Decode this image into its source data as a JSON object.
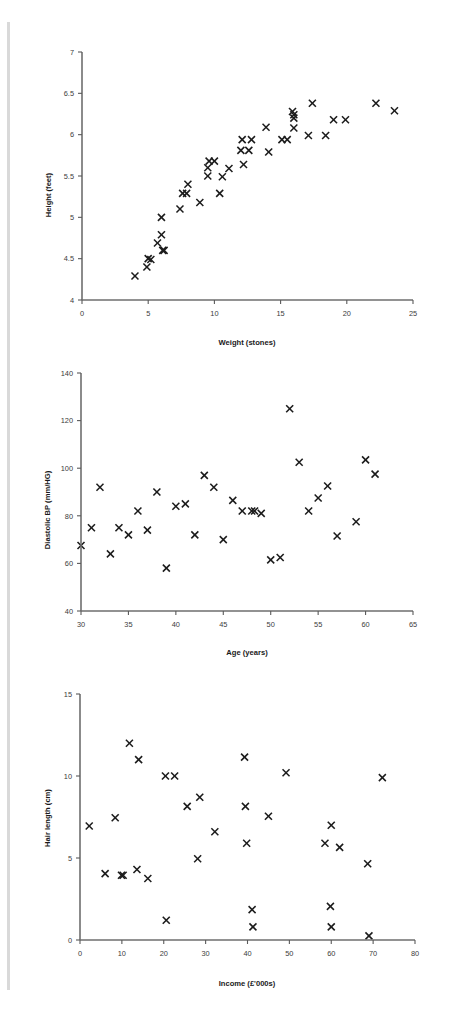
{
  "page": {
    "background_color": "#ffffff",
    "edge_bar_color": "#d9d9d9",
    "marker_color": "#1c1c1c",
    "axis_color": "#5a5a5a"
  },
  "charts": [
    {
      "id": "height-weight-scatter",
      "title": "",
      "xlabel": "Weight (stones)",
      "ylabel": "Height (feet)",
      "xticks": [
        "0",
        "5",
        "10",
        "15",
        "20",
        "25"
      ],
      "yticks": [
        "4",
        "4.5",
        "5",
        "5.5",
        "6",
        "6.5",
        "7"
      ]
    },
    {
      "id": "bp-age-scatter",
      "title": "",
      "xlabel": "Age (years)",
      "ylabel": "Diastolic BP (mm/HG)",
      "xticks": [
        "30",
        "35",
        "40",
        "45",
        "50",
        "55",
        "60",
        "65"
      ],
      "yticks": [
        "40",
        "60",
        "80",
        "100",
        "120",
        "140"
      ]
    },
    {
      "id": "hair-income-scatter",
      "title": "",
      "xlabel": "Income (£'000s)",
      "ylabel": "Hair length (cm)",
      "xticks": [
        "0",
        "10",
        "20",
        "30",
        "40",
        "50",
        "60",
        "70",
        "80"
      ],
      "yticks": [
        "0",
        "5",
        "10",
        "15"
      ]
    }
  ],
  "chart_data": [
    {
      "type": "scatter",
      "title": "",
      "xlabel": "Weight (stones)",
      "ylabel": "Height (feet)",
      "xlim": [
        0,
        25
      ],
      "ylim": [
        4,
        7
      ],
      "xticks": [
        0,
        5,
        10,
        15,
        20,
        25
      ],
      "yticks": [
        4,
        4.5,
        5,
        5.5,
        6,
        6.5,
        7
      ],
      "grid": false,
      "legend": "none",
      "marker": "x",
      "points": [
        [
          4.0,
          4.29
        ],
        [
          4.9,
          4.4
        ],
        [
          5.0,
          4.5
        ],
        [
          5.2,
          4.49
        ],
        [
          5.7,
          4.69
        ],
        [
          6.0,
          5.0
        ],
        [
          6.0,
          4.79
        ],
        [
          6.1,
          4.6
        ],
        [
          6.2,
          4.6
        ],
        [
          7.4,
          5.1
        ],
        [
          7.6,
          5.29
        ],
        [
          7.9,
          5.29
        ],
        [
          8.0,
          5.4
        ],
        [
          8.9,
          5.18
        ],
        [
          9.5,
          5.5
        ],
        [
          9.5,
          5.6
        ],
        [
          9.6,
          5.68
        ],
        [
          10.0,
          5.68
        ],
        [
          10.4,
          5.29
        ],
        [
          10.6,
          5.49
        ],
        [
          11.1,
          5.59
        ],
        [
          12.0,
          5.81
        ],
        [
          12.1,
          5.94
        ],
        [
          12.2,
          5.64
        ],
        [
          12.6,
          5.81
        ],
        [
          12.8,
          5.94
        ],
        [
          13.9,
          6.09
        ],
        [
          14.1,
          5.79
        ],
        [
          15.1,
          5.94
        ],
        [
          15.5,
          5.94
        ],
        [
          15.9,
          6.28
        ],
        [
          16.0,
          6.24
        ],
        [
          16.0,
          6.2
        ],
        [
          16.0,
          6.08
        ],
        [
          17.1,
          5.99
        ],
        [
          17.4,
          6.38
        ],
        [
          18.4,
          5.99
        ],
        [
          19.0,
          6.18
        ],
        [
          19.9,
          6.18
        ],
        [
          22.2,
          6.38
        ],
        [
          23.6,
          6.29
        ]
      ]
    },
    {
      "type": "scatter",
      "title": "",
      "xlabel": "Age (years)",
      "ylabel": "Diastolic BP (mm/HG)",
      "xlim": [
        30,
        65
      ],
      "ylim": [
        40,
        140
      ],
      "xticks": [
        30,
        35,
        40,
        45,
        50,
        55,
        60,
        65
      ],
      "yticks": [
        40,
        60,
        80,
        100,
        120,
        140
      ],
      "grid": false,
      "legend": "none",
      "marker": "x",
      "points": [
        [
          30.0,
          67.5
        ],
        [
          31.1,
          75.0
        ],
        [
          32.0,
          92.0
        ],
        [
          33.1,
          64.0
        ],
        [
          34.0,
          75.0
        ],
        [
          35.0,
          72.0
        ],
        [
          36.0,
          82.0
        ],
        [
          37.0,
          74.0
        ],
        [
          38.0,
          90.0
        ],
        [
          39.0,
          58.0
        ],
        [
          40.0,
          84.0
        ],
        [
          41.0,
          85.0
        ],
        [
          42.0,
          72.0
        ],
        [
          43.0,
          97.0
        ],
        [
          44.0,
          92.0
        ],
        [
          45.0,
          70.0
        ],
        [
          46.0,
          86.5
        ],
        [
          47.0,
          82.0
        ],
        [
          48.0,
          82.0
        ],
        [
          48.3,
          82.0
        ],
        [
          49.0,
          81.0
        ],
        [
          50.0,
          61.5
        ],
        [
          51.0,
          62.5
        ],
        [
          52.0,
          125.0
        ],
        [
          53.0,
          102.5
        ],
        [
          54.0,
          82.0
        ],
        [
          55.0,
          87.5
        ],
        [
          56.0,
          92.5
        ],
        [
          57.0,
          71.5
        ],
        [
          59.0,
          77.5
        ],
        [
          60.0,
          103.5
        ],
        [
          61.0,
          97.5
        ]
      ]
    },
    {
      "type": "scatter",
      "title": "",
      "xlabel": "Income (£'000s)",
      "ylabel": "Hair length (cm)",
      "xlim": [
        0,
        80
      ],
      "ylim": [
        0,
        15
      ],
      "xticks": [
        0,
        10,
        20,
        30,
        40,
        50,
        60,
        70,
        80
      ],
      "yticks": [
        0,
        5,
        10,
        15
      ],
      "grid": false,
      "legend": "none",
      "marker": "x",
      "points": [
        [
          2.2,
          6.95
        ],
        [
          6.0,
          4.05
        ],
        [
          8.4,
          7.45
        ],
        [
          9.9,
          3.95
        ],
        [
          10.3,
          3.95
        ],
        [
          11.8,
          12.0
        ],
        [
          13.6,
          4.3
        ],
        [
          14.0,
          11.0
        ],
        [
          16.2,
          3.75
        ],
        [
          20.4,
          10.0
        ],
        [
          20.6,
          1.2
        ],
        [
          22.6,
          10.0
        ],
        [
          25.6,
          8.15
        ],
        [
          28.1,
          4.95
        ],
        [
          28.6,
          8.7
        ],
        [
          32.2,
          6.6
        ],
        [
          39.3,
          11.15
        ],
        [
          39.5,
          8.15
        ],
        [
          39.8,
          5.9
        ],
        [
          41.1,
          1.85
        ],
        [
          41.3,
          0.8
        ],
        [
          45.0,
          7.55
        ],
        [
          49.2,
          10.2
        ],
        [
          58.5,
          5.9
        ],
        [
          59.8,
          2.05
        ],
        [
          60.0,
          7.0
        ],
        [
          60.0,
          0.8
        ],
        [
          62.0,
          5.65
        ],
        [
          68.7,
          4.65
        ],
        [
          69.0,
          0.25
        ],
        [
          72.2,
          9.9
        ]
      ]
    }
  ]
}
